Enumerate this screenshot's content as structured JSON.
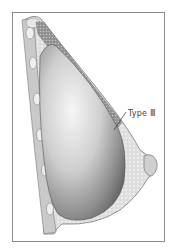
{
  "figure": {
    "label": "Type Ⅲ",
    "colors": {
      "frame": "#8a8a8a",
      "implant_light": "#f2f2f2",
      "implant_dark": "#6e6e6e",
      "tissue": "#d9d9d9",
      "muscle": "#9a9a9a",
      "skin_line": "#7a7a7a"
    }
  }
}
